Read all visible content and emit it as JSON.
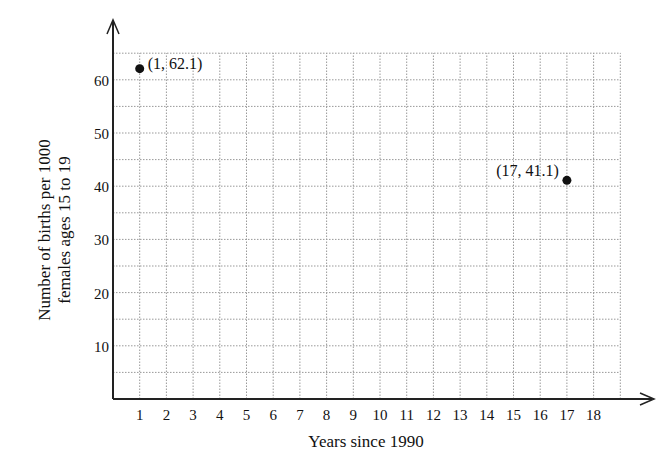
{
  "chart_data": {
    "type": "scatter",
    "title": "",
    "xlabel": "Years since 1990",
    "ylabel_lines": [
      "Number of births per 1000",
      "females ages 15 to 19"
    ],
    "x_ticks": [
      1,
      2,
      3,
      4,
      5,
      6,
      7,
      8,
      9,
      10,
      11,
      12,
      13,
      14,
      15,
      16,
      17,
      18
    ],
    "y_ticks": [
      10,
      20,
      30,
      40,
      50,
      60
    ],
    "xlim": [
      0,
      19
    ],
    "ylim": [
      0,
      65
    ],
    "grid": true,
    "grid_style": "dotted",
    "points": [
      {
        "x": 1,
        "y": 62.1,
        "label": "(1, 62.1)"
      },
      {
        "x": 17,
        "y": 41.1,
        "label": "(17, 41.1)"
      }
    ]
  }
}
